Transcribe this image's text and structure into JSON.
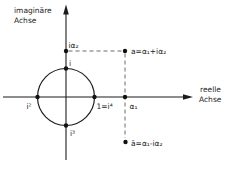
{
  "figure": {
    "description_colors": {
      "ink": "#1c1c1c",
      "background": "#ffffff",
      "dashed_line": "#5a5a5a"
    },
    "axes": {
      "imaginary_axis_label_line1": "imaginäre",
      "imaginary_axis_label_line2": "Achse",
      "real_axis_label_line1": "reelle",
      "real_axis_label_line2": "Achse"
    },
    "points": {
      "i_alpha2": "iα₂",
      "i": "i",
      "i_squared": "i²",
      "i_cubed": "i³",
      "one_equals_i4": "1=i⁴",
      "a": "a=α₁+iα₂",
      "alpha1": "α₁",
      "a_conjugate": "ā=α₁-iα₂"
    }
  }
}
